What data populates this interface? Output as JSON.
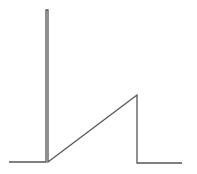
{
  "diagram": {
    "type": "waveform",
    "stroke_color": "#555555",
    "points": [
      [
        9,
        162
      ],
      [
        46,
        162
      ],
      [
        46,
        10
      ],
      [
        48,
        10
      ],
      [
        48,
        162
      ],
      [
        137,
        95
      ],
      [
        137,
        163
      ],
      [
        182,
        163
      ]
    ]
  }
}
